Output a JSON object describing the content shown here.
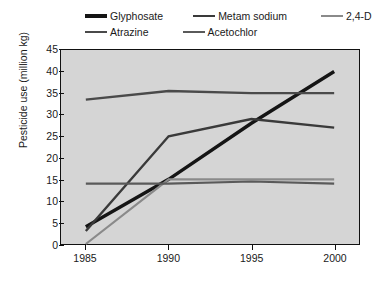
{
  "chart_data": {
    "type": "line",
    "title": "",
    "xlabel": "",
    "ylabel": "Pesticide use (million kg)",
    "categories": [
      "1985",
      "1990",
      "1995",
      "2000"
    ],
    "x": [
      1985,
      1990,
      1995,
      2000
    ],
    "xlim": [
      1983.5,
      2001.5
    ],
    "ylim": [
      0,
      45
    ],
    "yticks": [
      "0",
      "5",
      "10",
      "15",
      "20",
      "25",
      "30",
      "35",
      "40",
      "45"
    ],
    "ytick_values": [
      0,
      5,
      10,
      15,
      20,
      25,
      30,
      35,
      40,
      45
    ],
    "grid": false,
    "legend_position": "top",
    "plot_background": "#d5d5d5",
    "axis_color": "#111111",
    "series": [
      {
        "name": "Glyphosate",
        "values": [
          4,
          15,
          28,
          40
        ],
        "color": "#151515",
        "width": 3.4
      },
      {
        "name": "Metam sodium",
        "values": [
          3,
          25,
          29,
          27
        ],
        "color": "#3a3a3a",
        "width": 2.4
      },
      {
        "name": "2,4-D",
        "values": [
          0,
          15,
          15,
          15
        ],
        "color": "#8a8a8a",
        "width": 2.2
      },
      {
        "name": "Atrazine",
        "values": [
          33.5,
          35.5,
          35,
          35
        ],
        "color": "#4a4a4a",
        "width": 2.4
      },
      {
        "name": "Acetochlor",
        "values": [
          14,
          14,
          14.5,
          14
        ],
        "color": "#5a5a5a",
        "width": 2.2
      }
    ]
  },
  "legend": {
    "rows": [
      [
        {
          "label": "Glyphosate",
          "color": "#151515",
          "width": 3.4
        },
        {
          "label": "Metam sodium",
          "color": "#3a3a3a",
          "width": 2.8
        },
        {
          "label": "2,4-D",
          "color": "#8a8a8a",
          "width": 2.6
        }
      ],
      [
        {
          "label": "Atrazine",
          "color": "#4a4a4a",
          "width": 2.8
        },
        {
          "label": "Acetochlor",
          "color": "#5a5a5a",
          "width": 2.6
        }
      ]
    ]
  }
}
